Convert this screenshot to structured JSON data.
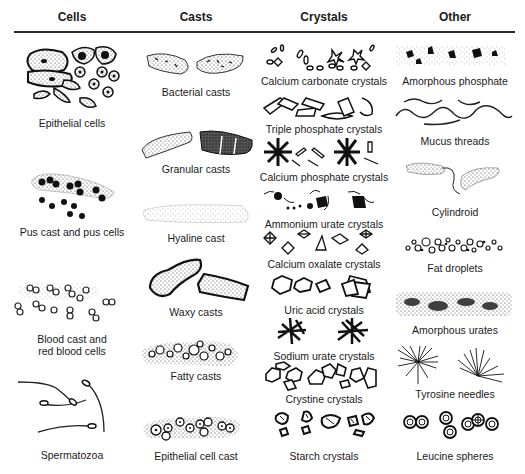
{
  "columns": [
    {
      "header": "Cells",
      "items": [
        {
          "label": "Epithelial cells"
        },
        {
          "label": "Pus cast and pus cells"
        },
        {
          "label_line1": "Blood cast and",
          "label_line2": "red blood cells"
        },
        {
          "label": "Spermatozoa"
        }
      ]
    },
    {
      "header": "Casts",
      "items": [
        {
          "label": "Bacterial casts"
        },
        {
          "label": "Granular casts"
        },
        {
          "label": "Hyaline cast"
        },
        {
          "label": "Waxy casts"
        },
        {
          "label": "Fatty casts"
        },
        {
          "label": "Epithelial cell cast"
        }
      ]
    },
    {
      "header": "Crystals",
      "items": [
        {
          "label": "Calcium carbonate crystals"
        },
        {
          "label": "Triple phosphate crystals"
        },
        {
          "label": "Calcium phosphate crystals"
        },
        {
          "label": "Ammonium urate crystals"
        },
        {
          "label": "Calcium oxalate crystals"
        },
        {
          "label": "Uric acid crystals"
        },
        {
          "label": "Sodium urate crystals"
        },
        {
          "label": "Crystine crystals"
        },
        {
          "label": "Starch crystals"
        }
      ]
    },
    {
      "header": "Other",
      "items": [
        {
          "label": "Amorphous phosphate"
        },
        {
          "label": "Mucus threads"
        },
        {
          "label": "Cylindroid"
        },
        {
          "label": "Fat droplets"
        },
        {
          "label": "Amorphous urates"
        },
        {
          "label": "Tyrosine needles"
        },
        {
          "label": "Leucine spheres"
        }
      ]
    }
  ]
}
